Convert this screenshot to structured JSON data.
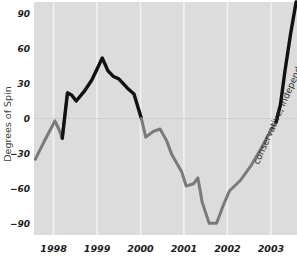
{
  "chart_data": {
    "type": "line",
    "title": "",
    "xlabel": "",
    "ylabel": "Degrees of Spin",
    "ylim": [
      -100,
      100
    ],
    "yticks": [
      90,
      60,
      30,
      0,
      -30,
      -60,
      -90
    ],
    "ytick_labels": [
      "90",
      "60",
      "30",
      "0",
      "−30",
      "−60",
      "−90"
    ],
    "xlim": [
      1997.55,
      2003.6
    ],
    "xticks": [
      1998,
      1999,
      2000,
      2001,
      2002,
      2003
    ],
    "xtick_labels": [
      "1998",
      "1999",
      "2000",
      "2001",
      "2002",
      "2003"
    ],
    "grid": "vertical gridlines at year ticks, white; single horizontal gridline at y=0",
    "legend": "none",
    "plot_bg": "#dcdcdc",
    "gridline_color": "#f2f2f2",
    "zero_line_color": "#cfcfcf",
    "series": [
      {
        "name": "Degrees of Spin (historical, gray)",
        "color": "#7a7a7a",
        "style": "solid",
        "width": 3,
        "points": [
          [
            1997.58,
            -35
          ],
          [
            1997.78,
            -20
          ],
          [
            1997.95,
            -8
          ],
          [
            1998.03,
            -2
          ],
          [
            1998.12,
            -9
          ],
          [
            1998.2,
            -17
          ],
          [
            1998.32,
            22
          ]
        ]
      },
      {
        "name": "Degrees of Spin (highlighted, black)",
        "color": "#111111",
        "style": "solid",
        "width": 3.4,
        "points": [
          [
            1998.2,
            -17
          ],
          [
            1998.32,
            22
          ],
          [
            1998.42,
            20
          ],
          [
            1998.52,
            15
          ],
          [
            1998.7,
            23
          ],
          [
            1998.88,
            33
          ],
          [
            1999.02,
            44
          ],
          [
            1999.12,
            52
          ],
          [
            1999.25,
            41
          ],
          [
            1999.38,
            36
          ],
          [
            1999.5,
            34
          ],
          [
            1999.7,
            26
          ],
          [
            1999.85,
            21
          ],
          [
            2000.02,
            0
          ]
        ]
      },
      {
        "name": "Degrees of Spin (decline, gray)",
        "color": "#7a7a7a",
        "style": "solid",
        "width": 3,
        "points": [
          [
            2000.02,
            0
          ],
          [
            2000.12,
            -16
          ],
          [
            2000.3,
            -11
          ],
          [
            2000.45,
            -9
          ],
          [
            2000.6,
            -19
          ],
          [
            2000.72,
            -31
          ],
          [
            2000.95,
            -46
          ],
          [
            2001.05,
            -58
          ],
          [
            2001.22,
            -56
          ],
          [
            2001.32,
            -51
          ],
          [
            2001.42,
            -72
          ],
          [
            2001.58,
            -90
          ],
          [
            2001.75,
            -90
          ],
          [
            2001.92,
            -73
          ],
          [
            2002.05,
            -62
          ],
          [
            2002.3,
            -53
          ],
          [
            2002.55,
            -40
          ],
          [
            2002.8,
            -24
          ],
          [
            2003.0,
            -10
          ],
          [
            2003.12,
            -3
          ]
        ]
      },
      {
        "name": "Conservative independent projection (black)",
        "color": "#111111",
        "style": "solid",
        "width": 3.4,
        "points": [
          [
            2003.12,
            -3
          ],
          [
            2003.22,
            12
          ],
          [
            2003.32,
            40
          ],
          [
            2003.45,
            72
          ],
          [
            2003.58,
            100
          ]
        ]
      }
    ],
    "annotations": [
      {
        "text": "conservative, independent projection",
        "rotation": -66,
        "color": "#2b2b2b",
        "anchor_x": 2002.72,
        "anchor_y": -40
      }
    ]
  }
}
